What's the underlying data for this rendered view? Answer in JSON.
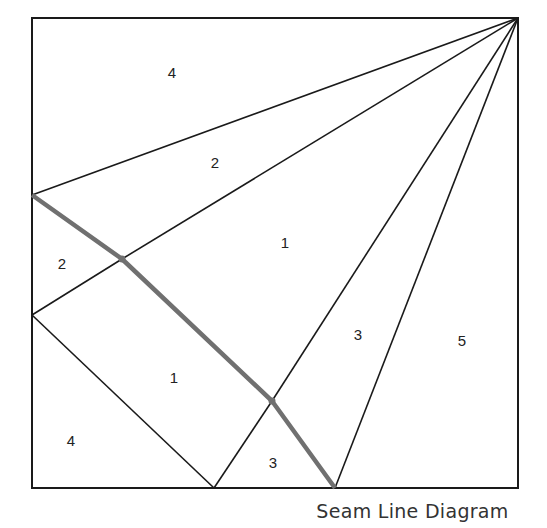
{
  "caption": "Seam Line Diagram",
  "colors": {
    "line": "#1a1a1a",
    "seam": "#707070",
    "text": "#222222"
  },
  "geometry": {
    "frame": {
      "x1": 32,
      "y1": 18,
      "x2": 518,
      "y2": 488
    },
    "apex": {
      "x": 518,
      "y": 18
    },
    "rays_to": [
      [
        32,
        195
      ],
      [
        122,
        259
      ],
      [
        272,
        401
      ],
      [
        335,
        488
      ]
    ],
    "lower_lines": [
      [
        [
          122,
          259
        ],
        [
          32,
          315
        ]
      ],
      [
        [
          32,
          315
        ],
        [
          214,
          488
        ]
      ],
      [
        [
          272,
          401
        ],
        [
          214,
          488
        ]
      ]
    ],
    "seam": [
      [
        32,
        195
      ],
      [
        122,
        259
      ],
      [
        272,
        401
      ],
      [
        335,
        488
      ]
    ]
  },
  "regions": [
    {
      "label": "4",
      "x": 172,
      "y": 78
    },
    {
      "label": "2",
      "x": 215,
      "y": 168
    },
    {
      "label": "1",
      "x": 285,
      "y": 248
    },
    {
      "label": "2",
      "x": 62,
      "y": 269
    },
    {
      "label": "3",
      "x": 358,
      "y": 340
    },
    {
      "label": "5",
      "x": 462,
      "y": 346
    },
    {
      "label": "1",
      "x": 174,
      "y": 383
    },
    {
      "label": "4",
      "x": 71,
      "y": 446
    },
    {
      "label": "3",
      "x": 273,
      "y": 468
    }
  ]
}
